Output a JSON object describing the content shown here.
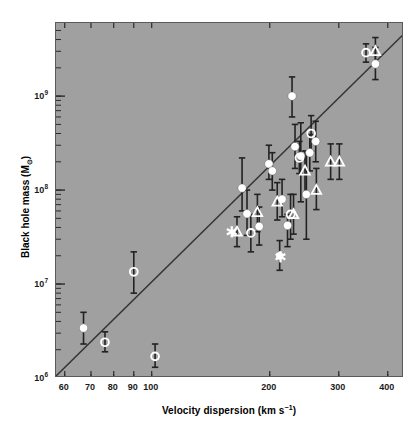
{
  "chart_data": {
    "type": "scatter",
    "title": "",
    "xlabel": "Velocity dispersion (km s−1)",
    "xlabel_main": "Velocity dispersion",
    "xlabel_unit_open": "(km s",
    "xlabel_unit_exp": "−1",
    "xlabel_unit_close": ")",
    "ylabel": "Black hole mass (M⊙)",
    "ylabel_main": "Black hole mass (M",
    "ylabel_sub": "⊙",
    "ylabel_close": ")",
    "xscale": "log",
    "yscale": "log",
    "xlim": [
      57,
      440
    ],
    "ylim": [
      1000000,
      6000000000
    ],
    "grid": false,
    "legend": "none",
    "background_color": "#a0a0a0",
    "marker_color": "#ffffff",
    "errorbar_color": "#222222",
    "fit_line_color": "#333333",
    "xticks": [
      {
        "value": 60,
        "label": "60"
      },
      {
        "value": 70,
        "label": "70"
      },
      {
        "value": 80,
        "label": "80"
      },
      {
        "value": 90,
        "label": "90"
      },
      {
        "value": 100,
        "label": "100"
      },
      {
        "value": 200,
        "label": "200"
      },
      {
        "value": 300,
        "label": "300"
      },
      {
        "value": 400,
        "label": "400"
      }
    ],
    "yticks": [
      {
        "value": 1000000,
        "mantissa": "10",
        "exponent": "6"
      },
      {
        "value": 10000000,
        "mantissa": "10",
        "exponent": "7"
      },
      {
        "value": 100000000,
        "mantissa": "10",
        "exponent": "8"
      },
      {
        "value": 1000000000,
        "mantissa": "10",
        "exponent": "9"
      }
    ],
    "fit_line": {
      "description": "M-sigma relation best fit",
      "x1": 57,
      "y1": 1050000,
      "x2": 440,
      "y2": 4600000000
    },
    "series": [
      {
        "name": "filled-circle",
        "marker": "filled-circle",
        "points": [
          {
            "x": 67,
            "y": 3400000.0,
            "yerr_low": 2300000.0,
            "yerr_high": 5000000.0
          },
          {
            "x": 170,
            "y": 105000000.0,
            "yerr_low": 60000000.0,
            "yerr_high": 220000000.0
          },
          {
            "x": 175,
            "y": 56000000.0,
            "yerr_low": 33000000.0,
            "yerr_high": 100000000.0
          },
          {
            "x": 188,
            "y": 41000000.0,
            "yerr_low": 26000000.0,
            "yerr_high": 66000000.0
          },
          {
            "x": 199,
            "y": 190000000.0,
            "yerr_low": 130000000.0,
            "yerr_high": 300000000.0
          },
          {
            "x": 203,
            "y": 160000000.0,
            "yerr_low": 100000000.0,
            "yerr_high": 250000000.0
          },
          {
            "x": 212,
            "y": 20000000.0,
            "yerr_low": 14000000.0,
            "yerr_high": 29000000.0
          },
          {
            "x": 215,
            "y": 80000000.0,
            "yerr_low": 52000000.0,
            "yerr_high": 130000000.0
          },
          {
            "x": 222,
            "y": 42000000.0,
            "yerr_low": 25000000.0,
            "yerr_high": 55000000.0
          },
          {
            "x": 228,
            "y": 1000000000.0,
            "yerr_low": 600000000.0,
            "yerr_high": 1600000000.0
          },
          {
            "x": 232,
            "y": 290000000.0,
            "yerr_low": 170000000.0,
            "yerr_high": 500000000.0
          },
          {
            "x": 240,
            "y": 230000000.0,
            "yerr_low": 75000000.0,
            "yerr_high": 520000000.0
          },
          {
            "x": 248,
            "y": 90000000.0,
            "yerr_low": 30000000.0,
            "yerr_high": 260000000.0
          },
          {
            "x": 253,
            "y": 250000000.0,
            "yerr_low": 160000000.0,
            "yerr_high": 390000000.0
          },
          {
            "x": 262,
            "y": 330000000.0,
            "yerr_low": 200000000.0,
            "yerr_high": 540000000.0
          },
          {
            "x": 372,
            "y": 2200000000.0,
            "yerr_low": 1500000000.0,
            "yerr_high": 3300000000.0
          }
        ]
      },
      {
        "name": "open-circle",
        "marker": "open-circle",
        "points": [
          {
            "x": 76,
            "y": 2400000.0,
            "yerr_low": 1900000.0,
            "yerr_high": 3100000.0
          },
          {
            "x": 90,
            "y": 13500000.0,
            "yerr_low": 8000000.0,
            "yerr_high": 22000000.0
          },
          {
            "x": 102,
            "y": 1700000.0,
            "yerr_low": 1300000.0,
            "yerr_high": 2300000.0
          },
          {
            "x": 179,
            "y": 35000000.0,
            "yerr_low": 22000000.0,
            "yerr_high": 55000000.0
          },
          {
            "x": 226,
            "y": 55000000.0,
            "yerr_low": 30000000.0,
            "yerr_high": 90000000.0
          },
          {
            "x": 238,
            "y": 220000000.0,
            "yerr_low": 150000000.0,
            "yerr_high": 330000000.0
          },
          {
            "x": 255,
            "y": 400000000.0,
            "yerr_low": 260000000.0,
            "yerr_high": 620000000.0
          },
          {
            "x": 352,
            "y": 2900000000.0,
            "yerr_low": 2300000000.0,
            "yerr_high": 3600000000.0
          }
        ]
      },
      {
        "name": "open-triangle",
        "marker": "open-triangle",
        "points": [
          {
            "x": 165,
            "y": 36000000.0,
            "yerr_low": 25000000.0,
            "yerr_high": 52000000.0
          },
          {
            "x": 186,
            "y": 58000000.0,
            "yerr_low": 36000000.0,
            "yerr_high": 90000000.0
          },
          {
            "x": 209,
            "y": 75000000.0,
            "yerr_low": 48000000.0,
            "yerr_high": 120000000.0
          },
          {
            "x": 230,
            "y": 55000000.0,
            "yerr_low": 34000000.0,
            "yerr_high": 90000000.0
          },
          {
            "x": 246,
            "y": 160000000.0,
            "yerr_low": 90000000.0,
            "yerr_high": 260000000.0
          },
          {
            "x": 263,
            "y": 100000000.0,
            "yerr_low": 62000000.0,
            "yerr_high": 170000000.0
          },
          {
            "x": 286,
            "y": 200000000.0,
            "yerr_low": 130000000.0,
            "yerr_high": 310000000.0
          },
          {
            "x": 301,
            "y": 200000000.0,
            "yerr_low": 130000000.0,
            "yerr_high": 310000000.0
          },
          {
            "x": 372,
            "y": 3000000000.0,
            "yerr_low": 2100000000.0,
            "yerr_high": 4200000000.0
          }
        ]
      },
      {
        "name": "asterisk",
        "marker": "asterisk",
        "points": [
          {
            "x": 160,
            "y": 36000000.0,
            "yerr_low": null,
            "yerr_high": null
          },
          {
            "x": 213,
            "y": 19500000.0,
            "yerr_low": null,
            "yerr_high": null
          }
        ]
      }
    ]
  }
}
